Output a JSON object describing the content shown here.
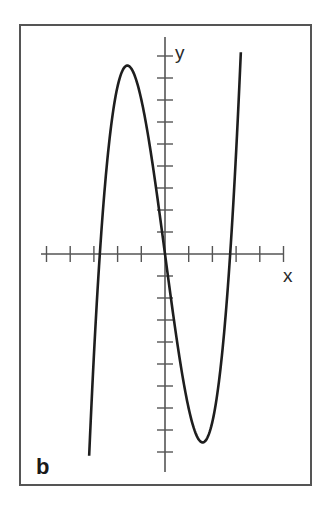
{
  "chart_data": {
    "type": "line",
    "title": "",
    "panel_label": "b",
    "xlabel": "x",
    "ylabel": "y",
    "xlim": [
      -5,
      5
    ],
    "ylim": [
      -10,
      10
    ],
    "x_ticks": [
      -5,
      -4,
      -3,
      -2,
      -1,
      1,
      2,
      3,
      4,
      5
    ],
    "y_ticks": [
      -9,
      -8,
      -7,
      -6,
      -5,
      -4,
      -3,
      -2,
      -1,
      1,
      2,
      3,
      4,
      5,
      6,
      7,
      8,
      9
    ],
    "tick_labels_shown": false,
    "grid": false,
    "series": [
      {
        "name": "cubic",
        "description": "cubic with roots near x = -2.75, 0, 2.75; local max ~8.6 near x = -1.6; local min ~-8.6 near x = 1.6",
        "function": {
          "kind": "cubic",
          "a": 1.07,
          "roots": [
            -2.75,
            0,
            2.75
          ]
        },
        "x_range": [
          -3.2,
          3.2
        ],
        "points": [
          [
            -3.2,
            -9.2
          ],
          [
            -2.75,
            0
          ],
          [
            -2.5,
            3.5
          ],
          [
            -2.0,
            7.6
          ],
          [
            -1.59,
            8.6
          ],
          [
            -1.0,
            7.0
          ],
          [
            -0.5,
            3.9
          ],
          [
            0,
            0
          ],
          [
            0.5,
            -3.9
          ],
          [
            1.0,
            -7.0
          ],
          [
            1.59,
            -8.6
          ],
          [
            2.0,
            -7.6
          ],
          [
            2.5,
            -3.5
          ],
          [
            2.75,
            0
          ],
          [
            3.2,
            9.2
          ]
        ]
      }
    ],
    "colors": {
      "curve": "#1e1e1e",
      "axes": "#555555",
      "frame": "#555555"
    }
  }
}
